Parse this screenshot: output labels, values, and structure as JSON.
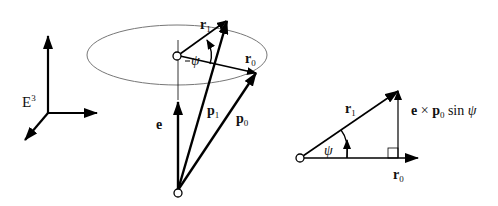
{
  "frame": {
    "label": "E",
    "sup": "3"
  },
  "main": {
    "e": "e",
    "p1": "p",
    "p1_sub": "1",
    "p0": "p",
    "p0_sub": "0",
    "r1": "r",
    "r1_sub": "1",
    "r0": "r",
    "r0_sub": "0",
    "psi": "ψ"
  },
  "triangle": {
    "r1": "r",
    "r1_sub": "1",
    "r0": "r",
    "r0_sub": "0",
    "psi": "ψ",
    "cross_e": "e",
    "cross_op": " × ",
    "cross_p": "p",
    "cross_p_sub": "0",
    "cross_sin": " sin ",
    "cross_psi": "ψ"
  }
}
